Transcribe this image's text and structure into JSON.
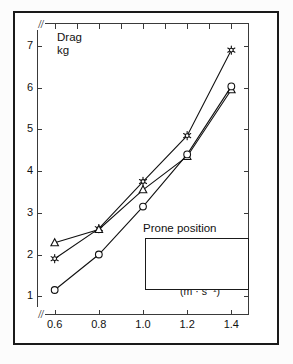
{
  "figure": {
    "frame_color": "#1a1a1a",
    "plot_color": "#3a3a3a"
  },
  "axes": {
    "y_title_line1": "Drag",
    "y_title_line2": "kg",
    "x_title_line1": "Velocity",
    "x_title_line2": "(m · s⁻¹)",
    "y_break": "//",
    "x_break": "//",
    "y_ticks": [
      "1",
      "2",
      "3",
      "4",
      "5",
      "6",
      "7"
    ],
    "x_ticks": [
      "0.6",
      "0.8",
      "1.0",
      "1.2",
      "1.4"
    ]
  },
  "legend": {
    "title": "Prone position",
    "items": [
      {
        "label": "No Support",
        "marker": "star-icon"
      },
      {
        "label": "Legs supp.",
        "marker": "triangle-icon"
      },
      {
        "label": "Arms supp.",
        "marker": "circle-icon"
      }
    ]
  },
  "chart_data": {
    "type": "line",
    "title": "",
    "subtitle": "Prone position",
    "xlabel": "Velocity (m · s⁻¹)",
    "ylabel": "Drag kg",
    "xlim": [
      0.52,
      1.48
    ],
    "ylim": [
      0.55,
      7.55
    ],
    "xticks": [
      0.6,
      0.8,
      1.0,
      1.2,
      1.4
    ],
    "yticks": [
      1,
      2,
      3,
      4,
      5,
      6,
      7
    ],
    "grid": false,
    "axis_break_x": true,
    "axis_break_y": true,
    "legend_position": "lower-right",
    "x": [
      0.6,
      0.8,
      1.0,
      1.2,
      1.4
    ],
    "series": [
      {
        "name": "No Support",
        "marker": "star",
        "values": [
          1.9,
          2.62,
          3.75,
          4.85,
          6.9
        ]
      },
      {
        "name": "Legs supp.",
        "marker": "triangle",
        "values": [
          2.28,
          2.6,
          3.55,
          4.35,
          5.95
        ]
      },
      {
        "name": "Arms supp.",
        "marker": "circle",
        "values": [
          1.15,
          2.0,
          3.15,
          4.4,
          6.03
        ]
      }
    ]
  }
}
